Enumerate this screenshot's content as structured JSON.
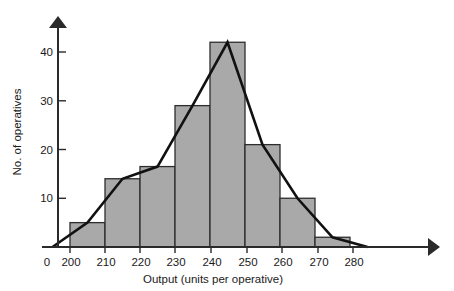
{
  "chart_data": {
    "type": "bar",
    "title": "",
    "subtitle": "",
    "xlabel": "Output (units per operative)",
    "ylabel": "No. of operatives",
    "categories": [
      "200-210",
      "210-220",
      "220-230",
      "230-240",
      "240-250",
      "250-260",
      "260-270",
      "270-280"
    ],
    "bin_edges": [
      200,
      210,
      220,
      230,
      240,
      250,
      260,
      270,
      280
    ],
    "values": [
      5,
      14,
      16.5,
      29,
      42,
      21,
      10,
      2
    ],
    "midpoints": [
      205,
      215,
      225,
      235,
      245,
      255,
      265,
      275
    ],
    "overlay": {
      "type": "line",
      "name": "frequency polygon",
      "x": [
        195,
        205,
        215,
        225,
        235,
        245,
        255,
        265,
        275,
        285
      ],
      "y": [
        0,
        5,
        14,
        16.5,
        29,
        42,
        21,
        10,
        2,
        0
      ]
    },
    "xlim": [
      195,
      292
    ],
    "ylim": [
      0,
      45
    ],
    "x_tick_values": [
      0,
      200,
      210,
      220,
      230,
      240,
      250,
      260,
      270,
      280
    ],
    "x_tick_labels": [
      "0",
      "200",
      "210",
      "220",
      "230",
      "240",
      "250",
      "260",
      "270",
      "280"
    ],
    "y_tick_values": [
      10,
      20,
      30,
      40
    ],
    "y_tick_labels": [
      "10",
      "20",
      "30",
      "40"
    ],
    "grid": false,
    "legend": false,
    "colors": {
      "bar_fill": "#a9a9a9",
      "bar_stroke": "#2d2d2d",
      "line": "#111111",
      "axis": "#2a2a2a",
      "background": "#ffffff",
      "text": "#1a1a1a"
    }
  },
  "axes": {
    "x_title": "Output (units per operative)",
    "y_title": "No. of operatives",
    "origin_label": "0"
  },
  "x_ticks": [
    {
      "label": "0"
    },
    {
      "label": "200"
    },
    {
      "label": "210"
    },
    {
      "label": "220"
    },
    {
      "label": "230"
    },
    {
      "label": "240"
    },
    {
      "label": "250"
    },
    {
      "label": "260"
    },
    {
      "label": "270"
    },
    {
      "label": "280"
    }
  ],
  "y_ticks": [
    {
      "label": "10"
    },
    {
      "label": "20"
    },
    {
      "label": "30"
    },
    {
      "label": "40"
    }
  ]
}
